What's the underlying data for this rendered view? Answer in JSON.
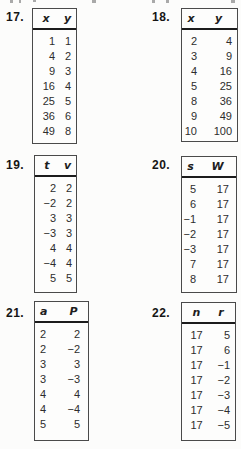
{
  "colors": {
    "page_background": "#fcfcfb",
    "table_border": "#4a4a4a",
    "header_rule": "#1c1c1c",
    "text": "#2d2d2d"
  },
  "tables": [
    {
      "number": "17.",
      "headers": [
        "x",
        "y"
      ],
      "rows": [
        [
          "1",
          "1"
        ],
        [
          "4",
          "2"
        ],
        [
          "9",
          "3"
        ],
        [
          "16",
          "4"
        ],
        [
          "25",
          "5"
        ],
        [
          "36",
          "6"
        ],
        [
          "49",
          "8"
        ]
      ]
    },
    {
      "number": "18.",
      "headers": [
        "x",
        "y"
      ],
      "rows": [
        [
          "2",
          "4"
        ],
        [
          "3",
          "9"
        ],
        [
          "4",
          "16"
        ],
        [
          "5",
          "25"
        ],
        [
          "8",
          "36"
        ],
        [
          "9",
          "49"
        ],
        [
          "10",
          "100"
        ]
      ]
    },
    {
      "number": "19.",
      "headers": [
        "t",
        "v"
      ],
      "rows": [
        [
          "2",
          "2"
        ],
        [
          "−2",
          "2"
        ],
        [
          "3",
          "3"
        ],
        [
          "−3",
          "3"
        ],
        [
          "4",
          "4"
        ],
        [
          "−4",
          "4"
        ],
        [
          "5",
          "5"
        ]
      ]
    },
    {
      "number": "20.",
      "headers": [
        "s",
        "W"
      ],
      "rows": [
        [
          "5",
          "17"
        ],
        [
          "6",
          "17"
        ],
        [
          "−1",
          "17"
        ],
        [
          "−2",
          "17"
        ],
        [
          "−3",
          "17"
        ],
        [
          "7",
          "17"
        ],
        [
          "8",
          "17"
        ]
      ]
    },
    {
      "number": "21.",
      "headers": [
        "a",
        "P"
      ],
      "rows": [
        [
          "2",
          "2"
        ],
        [
          "2",
          "−2"
        ],
        [
          "3",
          "3"
        ],
        [
          "3",
          "−3"
        ],
        [
          "4",
          "4"
        ],
        [
          "4",
          "−4"
        ],
        [
          "5",
          "5"
        ]
      ]
    },
    {
      "number": "22.",
      "headers": [
        "n",
        "r"
      ],
      "rows": [
        [
          "17",
          "5"
        ],
        [
          "17",
          "6"
        ],
        [
          "17",
          "−1"
        ],
        [
          "17",
          "−2"
        ],
        [
          "17",
          "−3"
        ],
        [
          "17",
          "−4"
        ],
        [
          "17",
          "−5"
        ]
      ]
    }
  ]
}
